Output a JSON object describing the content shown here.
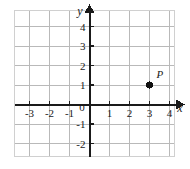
{
  "chart_data": {
    "type": "scatter",
    "title": "",
    "xlabel": "x",
    "ylabel": "y",
    "grid": true,
    "legend": false,
    "xlim": [
      -4,
      5
    ],
    "ylim": [
      -3,
      5
    ],
    "xticks": [
      "-3",
      "-2",
      "-1",
      "0",
      "1",
      "2",
      "3",
      "4"
    ],
    "xtick_values": [
      -3,
      -2,
      -1,
      0,
      1,
      2,
      3,
      4
    ],
    "yticks": [
      "4",
      "3",
      "2",
      "1",
      "-1",
      "-2"
    ],
    "ytick_values": [
      4,
      3,
      2,
      1,
      -1,
      -2
    ],
    "points": [
      {
        "label": "P",
        "x": 3,
        "y": 1
      }
    ]
  },
  "figure": {
    "origin_label": "0",
    "x_axis_label": "x",
    "y_axis_label": "y",
    "point_label": "P",
    "colors": {
      "grid": "#b9b9b9",
      "axis": "#1a1a1a",
      "point": "#111111",
      "background": "#ffffff",
      "border": "#d0d0d0"
    }
  }
}
